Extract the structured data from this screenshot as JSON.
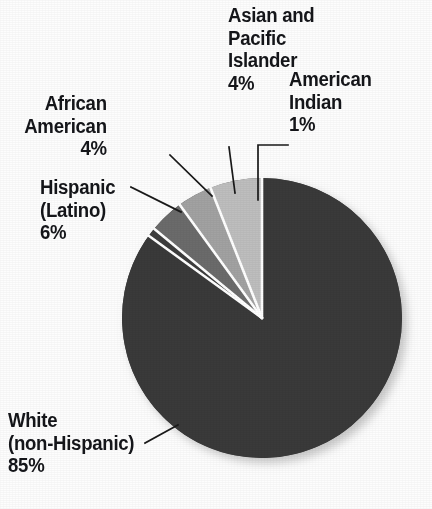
{
  "chart_data": {
    "type": "pie",
    "title": "",
    "subtitle": "",
    "xlabel": "",
    "ylabel": "",
    "legend_position": "none",
    "grid": false,
    "units": "percent",
    "start_angle_deg": 0,
    "direction": "clockwise",
    "categories": [
      "White (non-Hispanic)",
      "American Indian",
      "Asian and Pacific Islander",
      "African American",
      "Hispanic (Latino)"
    ],
    "values": [
      85,
      1,
      4,
      4,
      6
    ],
    "slices": [
      {
        "name": "white-non-hispanic",
        "label_lines": [
          "White",
          "(non-Hispanic)"
        ],
        "value_label": "85%",
        "value": 85,
        "color": "#3a3a3a",
        "start_deg": 0,
        "end_deg": 306
      },
      {
        "name": "american-indian",
        "label_lines": [
          "American",
          "Indian"
        ],
        "value_label": "1%",
        "value": 1,
        "color": "#3d3d3d",
        "start_deg": 306,
        "end_deg": 309.6
      },
      {
        "name": "asian-and-pacific-islander",
        "label_lines": [
          "Asian and",
          "Pacific",
          "Islander"
        ],
        "value_label": "4%",
        "value": 4,
        "color": "#6b6b6b",
        "start_deg": 309.6,
        "end_deg": 324
      },
      {
        "name": "african-american",
        "label_lines": [
          "African",
          "American"
        ],
        "value_label": "4%",
        "value": 4,
        "color": "#a2a2a2",
        "start_deg": 324,
        "end_deg": 338.4
      },
      {
        "name": "hispanic-latino",
        "label_lines": [
          "Hispanic",
          "(Latino)"
        ],
        "value_label": "6%",
        "value": 6,
        "color": "#bebebe",
        "start_deg": 338.4,
        "end_deg": 360
      }
    ]
  },
  "labels": {
    "asian_pacific": {
      "line1": "Asian and",
      "line2": "Pacific",
      "line3": "Islander",
      "value": "4%"
    },
    "american_indian": {
      "line1": "American",
      "line2": "Indian",
      "value": "1%"
    },
    "african_american": {
      "line1": "African",
      "line2": "American",
      "value": "4%"
    },
    "hispanic": {
      "line1": "Hispanic",
      "line2": "(Latino)",
      "value": "6%"
    },
    "white": {
      "line1": "White",
      "line2": "(non-Hispanic)",
      "value": "85%"
    }
  },
  "colors": {
    "background": "#fdfdfd",
    "text": "#15161a",
    "leader_line": "#1a1a1a",
    "slice_separator": "#ffffff",
    "dark_slice": "#3a3a3a",
    "mid_slice": "#6b6b6b",
    "light_slice": "#a2a2a2",
    "lightest_slice": "#bebebe",
    "shadow": "#d7d7d7"
  }
}
